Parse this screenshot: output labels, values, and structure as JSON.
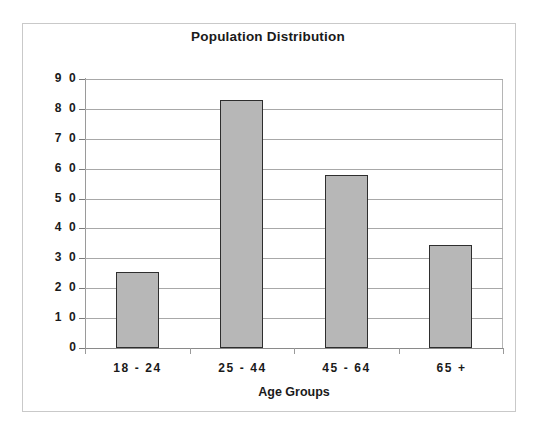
{
  "chart_data": {
    "type": "bar",
    "title": "Population Distribution",
    "xlabel": "Age Groups",
    "ylabel": "Millions of People",
    "categories": [
      "18 - 24",
      "25 - 44",
      "45 - 64",
      "65 +"
    ],
    "values": [
      25.5,
      83,
      58,
      34.5
    ],
    "ylim": [
      0,
      90
    ],
    "ytick_step": 10,
    "yticks": [
      90,
      80,
      70,
      60,
      50,
      40,
      30,
      20,
      10,
      0
    ],
    "ytick_labels": [
      "9 0",
      "8 0",
      "7 0",
      "6 0",
      "5 0",
      "4 0",
      "3 0",
      "2 0",
      "1 0",
      "0"
    ],
    "grid": true,
    "grid_axis": "y",
    "legend": false,
    "legend_position": "none",
    "bar_fill_color": "#b7b7b7",
    "bar_border_color": "#2e2e2e",
    "gridline_color": "#a8a8a8",
    "background_color": "#ffffff",
    "frame_color": "#c9c9c9",
    "text_color": "#1a1a1a"
  }
}
